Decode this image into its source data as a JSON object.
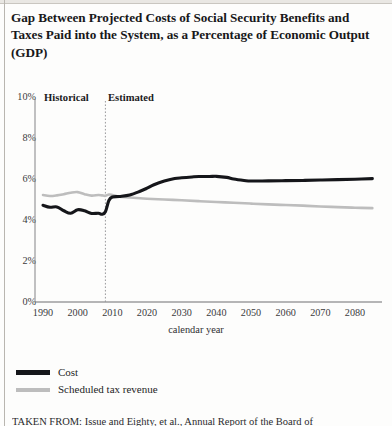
{
  "title": "Gap Between Projected Costs of Social Security Benefits and Taxes Paid into the System, as a Percentage of Economic Output (GDP)",
  "annotations": {
    "historical": "Historical",
    "estimated": "Estimated"
  },
  "legend": {
    "items": [
      {
        "label": "Cost",
        "color": "#15161a"
      },
      {
        "label": "Scheduled tax revenue",
        "color": "#bdbdbd"
      }
    ]
  },
  "footnote": "TAKEN FROM: Issue and Eighty, et al., Annual Report of the Board of",
  "chart_data": {
    "type": "line",
    "title": "Gap Between Projected Costs of Social Security Benefits and Taxes Paid into the System, as a Percentage of Economic Output (GDP)",
    "xlabel": "calendar year",
    "ylabel": "",
    "xlim": [
      1990,
      2085
    ],
    "ylim": [
      0,
      10
    ],
    "grid": false,
    "legend_position": "below-left",
    "ytick_labels": [
      "0%",
      "2%",
      "4%",
      "6%",
      "8%",
      "10%"
    ],
    "ytick_values": [
      0,
      2,
      4,
      6,
      8,
      10
    ],
    "xtick_labels": [
      "1990",
      "2000",
      "2010",
      "2020",
      "2030",
      "2040",
      "2050",
      "2060",
      "2070",
      "2080"
    ],
    "xtick_values": [
      1990,
      2000,
      2010,
      2020,
      2030,
      2040,
      2050,
      2060,
      2070,
      2080
    ],
    "divider_x": 2008,
    "divider_style": "dashed",
    "series": [
      {
        "name": "Cost",
        "color": "#15161a",
        "x": [
          1990,
          1992,
          1994,
          1996,
          1998,
          2000,
          2002,
          2004,
          2006,
          2007,
          2008,
          2009,
          2010,
          2012,
          2015,
          2018,
          2020,
          2022,
          2025,
          2028,
          2030,
          2033,
          2035,
          2038,
          2040,
          2043,
          2045,
          2048,
          2050,
          2055,
          2060,
          2065,
          2070,
          2075,
          2080,
          2085
        ],
        "values": [
          4.72,
          4.62,
          4.64,
          4.45,
          4.33,
          4.5,
          4.45,
          4.32,
          4.33,
          4.28,
          4.4,
          4.95,
          5.12,
          5.15,
          5.22,
          5.4,
          5.55,
          5.72,
          5.9,
          6.02,
          6.06,
          6.1,
          6.12,
          6.12,
          6.13,
          6.08,
          6.0,
          5.93,
          5.9,
          5.91,
          5.92,
          5.93,
          5.95,
          5.97,
          5.99,
          6.02
        ]
      },
      {
        "name": "Scheduled tax revenue",
        "color": "#bdbdbd",
        "x": [
          1990,
          1992,
          1994,
          1996,
          1998,
          2000,
          2002,
          2004,
          2006,
          2007,
          2008,
          2009,
          2010,
          2012,
          2015,
          2018,
          2020,
          2025,
          2030,
          2035,
          2040,
          2045,
          2050,
          2055,
          2060,
          2065,
          2070,
          2075,
          2080,
          2085
        ],
        "values": [
          5.22,
          5.17,
          5.2,
          5.26,
          5.33,
          5.36,
          5.26,
          5.19,
          5.22,
          5.2,
          5.18,
          5.24,
          5.22,
          5.14,
          5.1,
          5.06,
          5.04,
          5.0,
          4.96,
          4.92,
          4.88,
          4.84,
          4.8,
          4.76,
          4.73,
          4.7,
          4.66,
          4.63,
          4.6,
          4.58
        ]
      }
    ]
  }
}
